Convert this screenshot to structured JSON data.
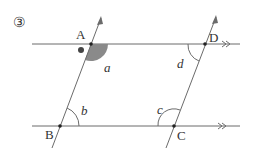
{
  "problem_number": "③",
  "colors": {
    "line": "#6b6b6b",
    "shade": "#8a8a8a",
    "dot": "#222222",
    "marker": "#444444"
  },
  "points": {
    "A": {
      "label": "A",
      "x": 91,
      "y": 44
    },
    "B": {
      "label": "B",
      "x": 60,
      "y": 126
    },
    "C": {
      "label": "C",
      "x": 174,
      "y": 126
    },
    "D": {
      "label": "D",
      "x": 205,
      "y": 44
    }
  },
  "angles": {
    "a": "a",
    "b": "b",
    "c": "c",
    "d": "d"
  },
  "parallel_lines": [
    "AD",
    "BC"
  ],
  "transversals": [
    "AB",
    "DC"
  ]
}
